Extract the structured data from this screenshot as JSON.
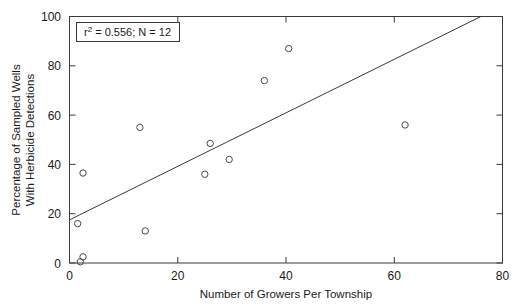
{
  "chart_data": {
    "type": "scatter",
    "title": "",
    "xlabel": "Number of Growers Per Township",
    "ylabel_line1": "Percentage of Sampled Wells",
    "ylabel_line2": "With Herbicide Detections",
    "xlim": [
      0,
      80
    ],
    "ylim": [
      0,
      100
    ],
    "xticks": [
      0,
      20,
      40,
      60,
      80
    ],
    "yticks": [
      0,
      20,
      40,
      60,
      80,
      100
    ],
    "xtick_labels": [
      "0",
      "20",
      "40",
      "60",
      "80"
    ],
    "ytick_labels": [
      "0",
      "20",
      "40",
      "60",
      "80",
      "100"
    ],
    "grid": false,
    "legend": false,
    "marker_style": "open-circle",
    "points": [
      {
        "x": 1.5,
        "y": 16
      },
      {
        "x": 2.0,
        "y": 0.5
      },
      {
        "x": 2.5,
        "y": 2.5
      },
      {
        "x": 2.5,
        "y": 36.5
      },
      {
        "x": 13.0,
        "y": 55
      },
      {
        "x": 14.0,
        "y": 13
      },
      {
        "x": 25.0,
        "y": 36
      },
      {
        "x": 26.0,
        "y": 48.5
      },
      {
        "x": 29.5,
        "y": 42
      },
      {
        "x": 36.0,
        "y": 74
      },
      {
        "x": 40.5,
        "y": 87
      },
      {
        "x": 62.0,
        "y": 56
      }
    ],
    "fit_line": {
      "x0": 0,
      "y0": 17.5,
      "x1": 76,
      "y1": 100
    },
    "annotation": {
      "r_squared_prefix": "r",
      "r_squared_sup": "2",
      "r_squared_text": " = 0.556; N = 12"
    }
  }
}
